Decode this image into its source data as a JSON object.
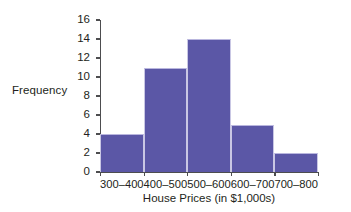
{
  "chart_data": {
    "type": "bar",
    "title": "",
    "subtitle": "",
    "xlabel": "House Prices (in $1,000s)",
    "ylabel": "Frequency",
    "categories": [
      "300–400",
      "400–500",
      "500–600",
      "600–700",
      "700–800"
    ],
    "values": [
      4,
      11,
      14,
      5,
      2
    ],
    "ylim": [
      0,
      16
    ],
    "ytick_values": [
      0,
      2,
      4,
      6,
      8,
      10,
      12,
      14,
      16
    ],
    "ytick_labels": [
      "0",
      "2",
      "4",
      "6",
      "8",
      "10",
      "12",
      "14",
      "16"
    ],
    "grid": false,
    "legend": null,
    "legend_position": "none",
    "bar_color": "#5b57a6",
    "axis_color": "#4d4d4f",
    "background_color": "#ffffff",
    "annotations": []
  }
}
